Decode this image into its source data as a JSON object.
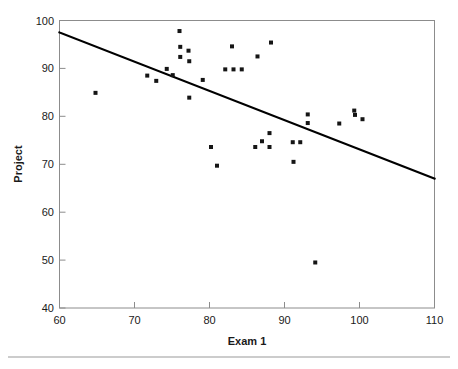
{
  "chart_data": {
    "type": "scatter",
    "title": "",
    "xlabel": "Exam 1",
    "ylabel": "Project",
    "xlim": [
      60,
      110
    ],
    "ylim": [
      40,
      100
    ],
    "xticks": [
      60,
      70,
      80,
      90,
      100,
      110
    ],
    "yticks": [
      40,
      50,
      60,
      70,
      80,
      90,
      100
    ],
    "xtick_labels": [
      "60",
      "70",
      "80",
      "90",
      "100",
      "110"
    ],
    "ytick_labels": [
      "40",
      "50",
      "60",
      "70",
      "80",
      "90",
      "100"
    ],
    "grid": false,
    "legend": null,
    "marker": "square",
    "marker_color": "#151515",
    "marker_size": 4,
    "points": [
      {
        "x": 64.8,
        "y": 84.9
      },
      {
        "x": 71.7,
        "y": 88.5
      },
      {
        "x": 72.9,
        "y": 87.4
      },
      {
        "x": 74.3,
        "y": 89.9
      },
      {
        "x": 75.1,
        "y": 88.6
      },
      {
        "x": 76.0,
        "y": 97.8
      },
      {
        "x": 76.1,
        "y": 94.5
      },
      {
        "x": 76.1,
        "y": 92.4
      },
      {
        "x": 77.2,
        "y": 93.7
      },
      {
        "x": 77.3,
        "y": 91.5
      },
      {
        "x": 77.3,
        "y": 83.9
      },
      {
        "x": 79.1,
        "y": 87.6
      },
      {
        "x": 80.2,
        "y": 73.6
      },
      {
        "x": 81.0,
        "y": 69.7
      },
      {
        "x": 82.1,
        "y": 89.8
      },
      {
        "x": 83.0,
        "y": 94.6
      },
      {
        "x": 83.2,
        "y": 89.8
      },
      {
        "x": 84.3,
        "y": 89.8
      },
      {
        "x": 86.1,
        "y": 73.6
      },
      {
        "x": 86.4,
        "y": 92.5
      },
      {
        "x": 87.0,
        "y": 74.8
      },
      {
        "x": 88.0,
        "y": 76.5
      },
      {
        "x": 88.0,
        "y": 73.6
      },
      {
        "x": 88.2,
        "y": 95.4
      },
      {
        "x": 91.1,
        "y": 74.6
      },
      {
        "x": 91.2,
        "y": 70.5
      },
      {
        "x": 92.1,
        "y": 74.6
      },
      {
        "x": 93.1,
        "y": 80.4
      },
      {
        "x": 93.1,
        "y": 78.6
      },
      {
        "x": 94.1,
        "y": 49.5
      },
      {
        "x": 97.3,
        "y": 78.5
      },
      {
        "x": 99.3,
        "y": 81.2
      },
      {
        "x": 99.4,
        "y": 80.3
      },
      {
        "x": 100.4,
        "y": 79.4
      }
    ],
    "regression_line": {
      "x1": 60,
      "y1": 97.5,
      "x2": 110,
      "y2": 67.0,
      "color": "#000000"
    }
  },
  "figure": {
    "background": "#ffffff",
    "frame_color": "#8c8c8c"
  }
}
